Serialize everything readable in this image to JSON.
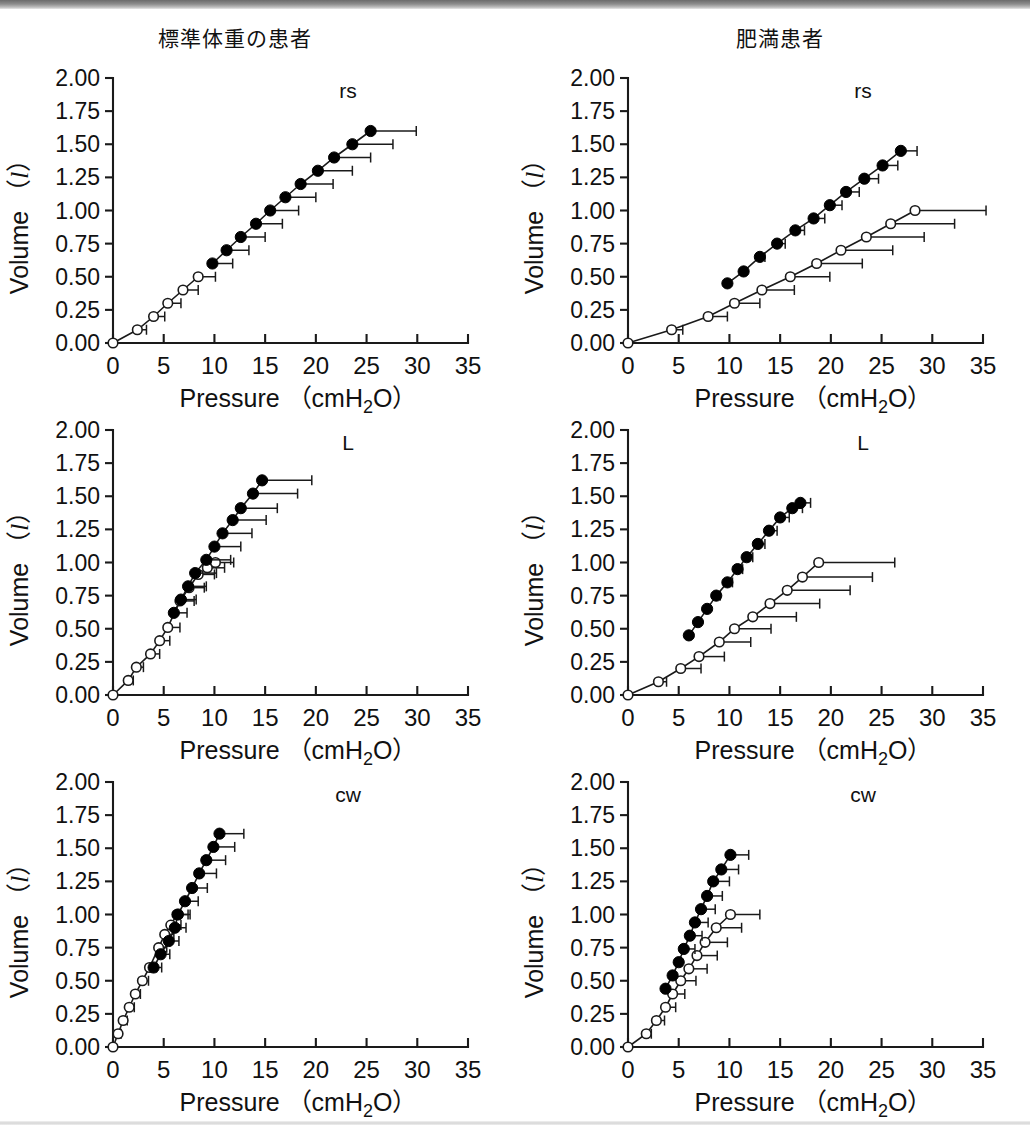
{
  "figure": {
    "titles": {
      "left": "標準体重の患者",
      "right": "肥満患者"
    },
    "axis": {
      "xlabel": "Pressure （cmH₂O）",
      "ylabel_pre": "Volume （",
      "ylabel_unit": "l",
      "ylabel_post": "）",
      "xticks": [
        "0",
        "5",
        "10",
        "15",
        "20",
        "25",
        "30",
        "35"
      ],
      "yticks": [
        "0.00",
        "0.25",
        "0.50",
        "0.75",
        "1.00",
        "1.25",
        "1.50",
        "1.75",
        "2.00"
      ]
    },
    "panel_tags": {
      "rs": "rs",
      "L": "L",
      "cw": "cw"
    },
    "colors": {
      "line": "#1a1a1a",
      "filled_marker": "#000000",
      "open_marker_fill": "#ffffff",
      "open_marker_stroke": "#1a1a1a",
      "errorbar": "#1a1a1a",
      "axis": "#1a1a1a",
      "background": "#ffffff"
    }
  },
  "chart_data": [
    {
      "id": "rs-normal",
      "type": "line",
      "title": "rs",
      "group": "標準体重の患者",
      "xlabel": "Pressure （cmH2O）",
      "ylabel": "Volume （l）",
      "xlim": [
        0,
        35
      ],
      "ylim": [
        0.0,
        2.0
      ],
      "grid": false,
      "legend": "none",
      "series": [
        {
          "name": "inspiratory-open",
          "marker": "open-circle",
          "x": [
            0.0,
            2.4,
            4.0,
            5.4,
            6.9,
            8.4
          ],
          "y": [
            0.0,
            0.1,
            0.2,
            0.3,
            0.4,
            0.5
          ],
          "xerr": [
            0.0,
            0.9,
            1.1,
            1.3,
            1.5,
            1.7
          ]
        },
        {
          "name": "inspiratory-filled",
          "marker": "filled-circle",
          "x": [
            9.8,
            11.2,
            12.6,
            14.1,
            15.5,
            17.0,
            18.5,
            20.2,
            21.8,
            23.6,
            25.4
          ],
          "y": [
            0.6,
            0.7,
            0.8,
            0.9,
            1.0,
            1.1,
            1.2,
            1.3,
            1.4,
            1.5,
            1.6
          ],
          "xerr": [
            2.0,
            2.2,
            2.4,
            2.6,
            2.8,
            3.0,
            3.2,
            3.4,
            3.6,
            4.0,
            4.5
          ]
        }
      ]
    },
    {
      "id": "rs-obese",
      "type": "line",
      "title": "rs",
      "group": "肥満患者",
      "xlabel": "Pressure （cmH2O）",
      "ylabel": "Volume （l）",
      "xlim": [
        0,
        35
      ],
      "ylim": [
        0.0,
        2.0
      ],
      "grid": false,
      "legend": "none",
      "series": [
        {
          "name": "open-circle-series",
          "marker": "open-circle",
          "x": [
            0.0,
            4.3,
            7.9,
            10.5,
            13.2,
            16.0,
            18.6,
            21.0,
            23.5,
            25.9,
            28.3
          ],
          "y": [
            0.0,
            0.1,
            0.2,
            0.3,
            0.4,
            0.5,
            0.6,
            0.7,
            0.8,
            0.9,
            1.0
          ],
          "xerr": [
            0.0,
            1.1,
            1.9,
            2.5,
            3.2,
            3.9,
            4.5,
            5.1,
            5.7,
            6.3,
            7.0
          ]
        },
        {
          "name": "filled-circle-series",
          "marker": "filled-circle",
          "x": [
            9.8,
            11.4,
            13.0,
            14.7,
            16.5,
            18.3,
            19.9,
            21.5,
            23.3,
            25.1,
            26.9
          ],
          "y": [
            0.45,
            0.54,
            0.65,
            0.75,
            0.85,
            0.94,
            1.04,
            1.14,
            1.24,
            1.34,
            1.45
          ],
          "xerr": [
            0.0,
            0.0,
            0.5,
            0.8,
            0.9,
            1.1,
            1.2,
            1.3,
            1.4,
            1.5,
            1.6
          ]
        }
      ]
    },
    {
      "id": "L-normal",
      "type": "line",
      "title": "L",
      "group": "標準体重の患者",
      "xlabel": "Pressure （cmH2O）",
      "ylabel": "Volume （l）",
      "xlim": [
        0,
        35
      ],
      "ylim": [
        0.0,
        2.0
      ],
      "grid": false,
      "legend": "none",
      "series": [
        {
          "name": "open-circle-series",
          "marker": "open-circle",
          "x": [
            0.0,
            1.5,
            2.3,
            3.7,
            4.6,
            5.4,
            6.6,
            7.5,
            8.4,
            9.3,
            10.1
          ],
          "y": [
            0.0,
            0.11,
            0.21,
            0.31,
            0.41,
            0.51,
            0.71,
            0.81,
            0.91,
            0.96,
            1.0
          ],
          "xerr": [
            0.0,
            0.5,
            0.7,
            0.9,
            1.0,
            1.2,
            1.4,
            1.5,
            1.6,
            1.7,
            1.8
          ]
        },
        {
          "name": "filled-circle-series",
          "marker": "filled-circle",
          "x": [
            6.0,
            6.7,
            7.4,
            8.1,
            9.2,
            10.0,
            10.8,
            11.8,
            12.6,
            13.8,
            14.7
          ],
          "y": [
            0.62,
            0.72,
            0.82,
            0.92,
            1.02,
            1.12,
            1.22,
            1.32,
            1.41,
            1.52,
            1.62
          ],
          "xerr": [
            1.3,
            1.5,
            1.8,
            2.1,
            2.4,
            2.6,
            2.9,
            3.3,
            3.6,
            4.4,
            4.9
          ]
        }
      ]
    },
    {
      "id": "L-obese",
      "type": "line",
      "title": "L",
      "group": "肥満患者",
      "xlabel": "Pressure （cmH2O）",
      "ylabel": "Volume （l）",
      "xlim": [
        0,
        35
      ],
      "ylim": [
        0.0,
        2.0
      ],
      "grid": false,
      "legend": "none",
      "series": [
        {
          "name": "open-circle-series",
          "marker": "open-circle",
          "x": [
            0.0,
            3.0,
            5.2,
            7.0,
            9.0,
            10.5,
            12.3,
            14.0,
            15.7,
            17.2,
            18.8
          ],
          "y": [
            0.0,
            0.1,
            0.2,
            0.29,
            0.4,
            0.5,
            0.59,
            0.69,
            0.79,
            0.89,
            1.0
          ],
          "xerr": [
            0.0,
            0.8,
            2.0,
            2.5,
            3.1,
            3.6,
            4.3,
            4.9,
            6.2,
            6.9,
            7.5
          ]
        },
        {
          "name": "filled-circle-series",
          "marker": "filled-circle",
          "x": [
            6.0,
            6.9,
            7.8,
            8.7,
            9.8,
            10.8,
            11.7,
            12.8,
            13.9,
            15.0,
            16.2,
            17.0
          ],
          "y": [
            0.45,
            0.55,
            0.65,
            0.75,
            0.85,
            0.95,
            1.04,
            1.14,
            1.24,
            1.34,
            1.41,
            1.45
          ],
          "xerr": [
            0.0,
            0.0,
            0.0,
            0.4,
            0.5,
            0.5,
            0.6,
            0.7,
            0.8,
            0.9,
            1.0,
            1.0
          ]
        }
      ]
    },
    {
      "id": "cw-normal",
      "type": "line",
      "title": "cw",
      "group": "標準体重の患者",
      "xlabel": "Pressure （cmH2O）",
      "ylabel": "Volume （l）",
      "xlim": [
        0,
        35
      ],
      "ylim": [
        0.0,
        2.0
      ],
      "grid": false,
      "legend": "none",
      "series": [
        {
          "name": "open-circle-series",
          "marker": "open-circle",
          "x": [
            0.0,
            0.5,
            1.0,
            1.6,
            2.2,
            2.9,
            3.6,
            4.5,
            5.1,
            5.7,
            6.3
          ],
          "y": [
            0.0,
            0.1,
            0.2,
            0.3,
            0.4,
            0.5,
            0.6,
            0.75,
            0.85,
            0.92,
            1.0
          ],
          "xerr": [
            0.0,
            0.3,
            0.4,
            0.5,
            0.5,
            0.6,
            0.7,
            0.8,
            0.9,
            1.0,
            1.1
          ]
        },
        {
          "name": "filled-circle-series",
          "marker": "filled-circle",
          "x": [
            4.0,
            4.7,
            5.5,
            6.1,
            6.4,
            7.1,
            7.8,
            8.5,
            9.2,
            9.9,
            10.5
          ],
          "y": [
            0.6,
            0.7,
            0.8,
            0.9,
            1.0,
            1.1,
            1.2,
            1.31,
            1.41,
            1.51,
            1.61
          ],
          "xerr": [
            0.8,
            0.9,
            1.0,
            1.1,
            1.2,
            1.3,
            1.5,
            1.7,
            1.9,
            2.1,
            2.4
          ]
        }
      ]
    },
    {
      "id": "cw-obese",
      "type": "line",
      "title": "cw",
      "group": "肥満患者",
      "xlabel": "Pressure （cmH2O）",
      "ylabel": "Volume （l）",
      "xlim": [
        0,
        35
      ],
      "ylim": [
        0.0,
        2.0
      ],
      "grid": false,
      "legend": "none",
      "series": [
        {
          "name": "open-circle-series",
          "marker": "open-circle",
          "x": [
            0.0,
            1.8,
            2.8,
            3.7,
            4.4,
            5.2,
            6.0,
            6.8,
            7.6,
            8.7,
            10.1
          ],
          "y": [
            0.0,
            0.1,
            0.2,
            0.3,
            0.4,
            0.5,
            0.59,
            0.69,
            0.79,
            0.9,
            1.0
          ],
          "xerr": [
            0.0,
            0.5,
            0.8,
            1.0,
            1.2,
            1.5,
            1.8,
            2.0,
            2.2,
            2.5,
            2.9
          ]
        },
        {
          "name": "filled-circle-series",
          "marker": "filled-circle",
          "x": [
            3.7,
            4.4,
            5.0,
            5.5,
            6.1,
            6.6,
            7.2,
            7.8,
            8.4,
            9.2,
            10.1
          ],
          "y": [
            0.44,
            0.54,
            0.64,
            0.74,
            0.84,
            0.94,
            1.04,
            1.14,
            1.25,
            1.34,
            1.45
          ],
          "xerr": [
            0.0,
            0.0,
            0.0,
            1.1,
            1.2,
            1.3,
            1.4,
            1.5,
            1.6,
            1.7,
            1.8
          ]
        }
      ]
    }
  ]
}
